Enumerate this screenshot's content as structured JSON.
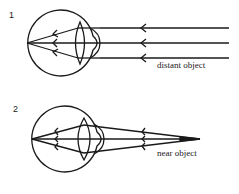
{
  "diagrams": [
    {
      "number": "1",
      "label": "distant object",
      "description": "Parallel rays from a distant object focused on the retina"
    },
    {
      "number": "2",
      "label": "near object",
      "description": "Diverging rays from a near object focused by a thicker lens"
    }
  ],
  "colors": {
    "stroke": "#1a1a1a",
    "background": "#ffffff"
  }
}
